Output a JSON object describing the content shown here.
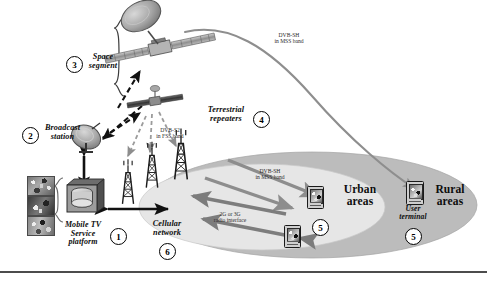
{
  "diagram": {
    "nodes": [
      {
        "id": "mobile-tv-platform",
        "number": "1",
        "label_lines": [
          "Mobile TV",
          "Service",
          "platform"
        ]
      },
      {
        "id": "broadcast-station",
        "number": "2",
        "label_lines": [
          "Broadcast",
          "station"
        ]
      },
      {
        "id": "space-segment",
        "number": "3",
        "label_lines": [
          "Space",
          "segment"
        ]
      },
      {
        "id": "terrestrial-repeaters",
        "number": "4",
        "label_lines": [
          "Terrestrial",
          "repeaters"
        ]
      },
      {
        "id": "user-terminal",
        "number": "5",
        "label_lines": [
          "User",
          "terminal"
        ]
      },
      {
        "id": "cellular-network",
        "number": "6",
        "label_lines": [
          "Cellular",
          "network"
        ]
      }
    ],
    "links": [
      {
        "id": "feeder-uplink",
        "lines": [
          "DVB-S2",
          "in FSS band"
        ]
      },
      {
        "id": "satellite-downlink",
        "lines": [
          "DVB-SH",
          "in MSS band"
        ]
      },
      {
        "id": "repeater-downlink",
        "lines": [
          "DVB-SH",
          "in MSS band"
        ]
      },
      {
        "id": "cellular-return",
        "lines": [
          "2G or 3G",
          "radio interface"
        ]
      }
    ],
    "coverage": [
      {
        "id": "urban-areas",
        "lines": [
          "Urban",
          "areas"
        ]
      },
      {
        "id": "rural-areas",
        "lines": [
          "Rural",
          "areas"
        ]
      }
    ],
    "numbers": {
      "platform": "1",
      "broadcast": "2",
      "space": "3",
      "repeaters": "4",
      "terminal_left": "5",
      "terminal_right": "5",
      "cellular": "6"
    },
    "colors": {
      "ink": "#0d0d0d",
      "arrow_gray": "#8a8a8a",
      "ellipse_outer": "#b9b9b9",
      "ellipse_inner": "#e3e3e3",
      "satellite_body": "#9a9a9a",
      "satellite_dark": "#4a4a4a"
    }
  }
}
